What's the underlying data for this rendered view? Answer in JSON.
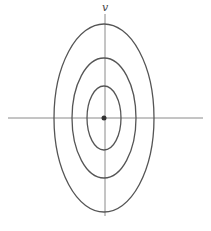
{
  "diagram": {
    "axis_label_vertical": "v",
    "center": {
      "x": 104,
      "y": 118
    },
    "colors": {
      "axis": "#8a8a8a",
      "ellipse": "#555555",
      "point": "#333333"
    },
    "ellipses": [
      {
        "name": "outer",
        "rx": 50,
        "ry": 94
      },
      {
        "name": "middle",
        "rx": 32,
        "ry": 60
      },
      {
        "name": "inner",
        "rx": 17,
        "ry": 32
      }
    ]
  }
}
